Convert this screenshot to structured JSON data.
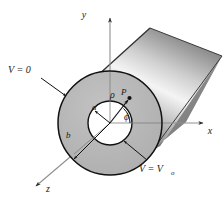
{
  "figure": {
    "type": "technical-diagram",
    "background_color": "#ffffff"
  },
  "axes": {
    "y": {
      "label": "y",
      "direction": "up"
    },
    "x": {
      "label": "x",
      "direction": "right"
    },
    "z": {
      "label": "z",
      "direction": "down-left"
    },
    "line_color": "#8a8a8a",
    "arrow_color": "#222222"
  },
  "annotations": {
    "outer_boundary": {
      "label": "V = 0",
      "target": "outer-cylinder-surface"
    },
    "inner_boundary": {
      "label": "V = V",
      "subscript": "o",
      "target": "inner-cylinder-surface"
    },
    "inner_radius": {
      "label": "a"
    },
    "outer_radius": {
      "label": "b"
    },
    "radial_coordinate": {
      "label": "ρ"
    },
    "azimuthal_angle": {
      "label": "ϕ"
    },
    "field_point": {
      "label": "P",
      "marker": "dot"
    }
  },
  "colors": {
    "annulus_fill": "#b6b6b6",
    "inner_fill": "#ffffff",
    "outline": "#111111",
    "body_dark": "#6e6e6e",
    "body_mid": "#9a9a9a",
    "body_highlight": "#fdfdfd",
    "body_shadow": "#4a4a4a"
  },
  "geometry": {
    "center": {
      "x": 110,
      "y": 123
    },
    "outer_radius_px": 52,
    "inner_radius_px": 22,
    "phi_degrees": 42
  }
}
